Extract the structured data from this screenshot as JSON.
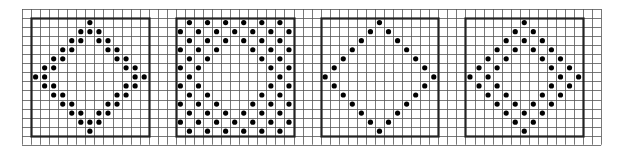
{
  "grid": {
    "origin_x": 22,
    "origin_y": 9,
    "cell": 9.05,
    "cols": 64,
    "rows": 15,
    "line_color": "#555555",
    "box_color": "#222222",
    "dot_color": "#000000"
  },
  "panels": [
    {
      "name": "panel-double-diamond",
      "box_col": 1,
      "box_row": 1,
      "size": 13,
      "dots": [
        [
          1,
          [
            7
          ]
        ],
        [
          2,
          [
            6,
            7,
            8
          ]
        ],
        [
          3,
          [
            5,
            6,
            8,
            9
          ]
        ],
        [
          4,
          [
            4,
            5,
            9,
            10
          ]
        ],
        [
          5,
          [
            3,
            4,
            10,
            11
          ]
        ],
        [
          6,
          [
            2,
            3,
            11,
            12
          ]
        ],
        [
          7,
          [
            1,
            2,
            12,
            13
          ]
        ],
        [
          8,
          [
            2,
            3,
            11,
            12
          ]
        ],
        [
          9,
          [
            3,
            4,
            10,
            11
          ]
        ],
        [
          10,
          [
            4,
            5,
            9,
            10
          ]
        ],
        [
          11,
          [
            5,
            6,
            8,
            9
          ]
        ],
        [
          12,
          [
            6,
            7,
            8
          ]
        ],
        [
          13,
          [
            7
          ]
        ]
      ]
    },
    {
      "name": "panel-checker-diamond",
      "box_col": 17,
      "box_row": 1,
      "size": 13,
      "dots": [
        [
          1,
          [
            2,
            4,
            6,
            8,
            10,
            12
          ]
        ],
        [
          2,
          [
            1,
            3,
            5,
            7,
            9,
            11,
            13
          ]
        ],
        [
          3,
          [
            2,
            4,
            6,
            8,
            10,
            12
          ]
        ],
        [
          4,
          [
            1,
            3,
            5,
            9,
            11,
            13
          ]
        ],
        [
          5,
          [
            2,
            4,
            10,
            12
          ]
        ],
        [
          6,
          [
            1,
            3,
            11,
            13
          ]
        ],
        [
          7,
          [
            2,
            12
          ]
        ],
        [
          8,
          [
            1,
            3,
            11,
            13
          ]
        ],
        [
          9,
          [
            2,
            4,
            10,
            12
          ]
        ],
        [
          10,
          [
            1,
            3,
            5,
            9,
            11,
            13
          ]
        ],
        [
          11,
          [
            2,
            4,
            6,
            8,
            10,
            12
          ]
        ],
        [
          12,
          [
            1,
            3,
            5,
            7,
            9,
            11,
            13
          ]
        ],
        [
          13,
          [
            2,
            4,
            6,
            8,
            10,
            12
          ]
        ]
      ]
    },
    {
      "name": "panel-single-diamond",
      "box_col": 33,
      "box_row": 1,
      "size": 13,
      "dots": [
        [
          1,
          [
            7
          ]
        ],
        [
          2,
          [
            6,
            8
          ]
        ],
        [
          3,
          [
            5,
            9
          ]
        ],
        [
          4,
          [
            4,
            10
          ]
        ],
        [
          5,
          [
            3,
            11
          ]
        ],
        [
          6,
          [
            2,
            12
          ]
        ],
        [
          7,
          [
            1,
            13
          ]
        ],
        [
          8,
          [
            2,
            12
          ]
        ],
        [
          9,
          [
            3,
            11
          ]
        ],
        [
          10,
          [
            4,
            10
          ]
        ],
        [
          11,
          [
            5,
            9
          ]
        ],
        [
          12,
          [
            6,
            8
          ]
        ],
        [
          13,
          [
            7
          ]
        ]
      ]
    },
    {
      "name": "panel-spaced-double-diamond",
      "box_col": 49,
      "box_row": 1,
      "size": 13,
      "dots": [
        [
          1,
          [
            7
          ]
        ],
        [
          2,
          [
            6,
            8
          ]
        ],
        [
          3,
          [
            5,
            7,
            9
          ]
        ],
        [
          4,
          [
            4,
            6,
            8,
            10
          ]
        ],
        [
          5,
          [
            3,
            5,
            9,
            11
          ]
        ],
        [
          6,
          [
            2,
            4,
            10,
            12
          ]
        ],
        [
          7,
          [
            1,
            3,
            11,
            13
          ]
        ],
        [
          8,
          [
            2,
            4,
            10,
            12
          ]
        ],
        [
          9,
          [
            3,
            5,
            9,
            11
          ]
        ],
        [
          10,
          [
            4,
            6,
            8,
            10
          ]
        ],
        [
          11,
          [
            5,
            7,
            9
          ]
        ],
        [
          12,
          [
            6,
            8
          ]
        ],
        [
          13,
          [
            7
          ]
        ]
      ]
    }
  ]
}
